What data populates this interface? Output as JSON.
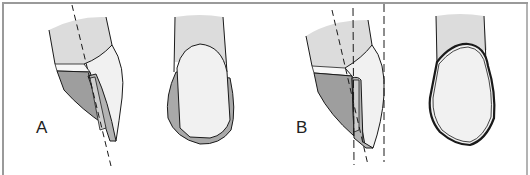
{
  "figure": {
    "panels": [
      {
        "id": "A",
        "label": "A",
        "views": [
          "lateral-section",
          "facial-view"
        ],
        "guide_lines": 1
      },
      {
        "id": "B",
        "label": "B",
        "views": [
          "lateral-section",
          "facial-view"
        ],
        "guide_lines": 3
      }
    ],
    "colors": {
      "frame": "#9a9a9a",
      "root": "#dedede",
      "enamel": "#f2f2f2",
      "veneer": "#a9a9a9",
      "stroke": "#1a1a1a",
      "background": "#ffffff"
    }
  }
}
